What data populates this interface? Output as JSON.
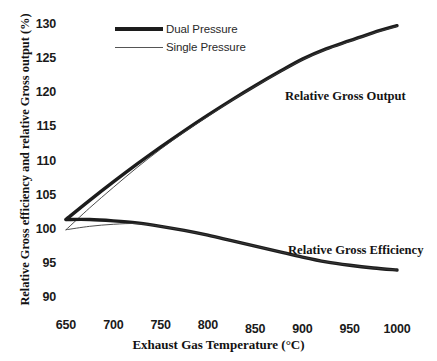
{
  "chart_data": {
    "type": "line",
    "title": "",
    "xlabel": "Exhaust Gas Temperature (°C)",
    "ylabel": "Relative Gross efficiency and relative Gross output (%)",
    "xlim": [
      630,
      1015
    ],
    "ylim": [
      89,
      131
    ],
    "xticks": [
      650,
      700,
      750,
      800,
      850,
      900,
      950,
      1000
    ],
    "xtick_labels": [
      "650",
      "700",
      "750",
      "800",
      "850",
      "900",
      "950",
      "1000"
    ],
    "yticks": [
      90,
      95,
      100,
      105,
      110,
      115,
      120,
      125,
      130
    ],
    "ytick_labels": [
      "90",
      "95",
      "100",
      "105",
      "110",
      "115",
      "120",
      "125",
      "130"
    ],
    "grid": false,
    "axis_lines_visible": false,
    "legend_position": "top-left-inside",
    "legend": [
      "Dual Pressure",
      "Single Pressure"
    ],
    "annotations": [
      {
        "text": "Relative Gross Output",
        "x": 905,
        "y": 119.5
      },
      {
        "text": "Relative Gross Efficiency",
        "x": 910,
        "y": 98.2
      }
    ],
    "series": [
      {
        "name": "Dual Pressure - Relative Gross Output",
        "group": "Relative Gross Output",
        "style": "thick",
        "color": "#1c1c1c",
        "x": [
          650,
          675,
          700,
          725,
          750,
          775,
          800,
          825,
          850,
          875,
          900,
          925,
          950,
          975,
          1000
        ],
        "y": [
          101.5,
          104.3,
          107.0,
          109.6,
          112.1,
          114.5,
          116.8,
          119.0,
          121.1,
          123.1,
          125.0,
          126.5,
          127.7,
          128.9,
          129.9
        ]
      },
      {
        "name": "Single Pressure - Relative Gross Output",
        "group": "Relative Gross Output",
        "style": "thin",
        "color": "#3a3a3a",
        "x": [
          650,
          675,
          700,
          725,
          750,
          775,
          800,
          825,
          850,
          875,
          900,
          925,
          950,
          975,
          1000
        ],
        "y": [
          100.0,
          103.2,
          106.2,
          109.1,
          111.8,
          114.3,
          116.6,
          118.9,
          121.0,
          123.0,
          124.9,
          126.4,
          127.6,
          128.8,
          129.8
        ]
      },
      {
        "name": "Dual Pressure - Relative Gross Efficiency",
        "group": "Relative Gross Efficiency",
        "style": "thick",
        "color": "#1c1c1c",
        "x": [
          650,
          675,
          700,
          725,
          750,
          775,
          800,
          825,
          850,
          875,
          900,
          925,
          950,
          975,
          1000
        ],
        "y": [
          101.5,
          101.5,
          101.3,
          101.0,
          100.5,
          99.9,
          99.2,
          98.4,
          97.6,
          96.8,
          96.0,
          95.3,
          94.8,
          94.4,
          94.1
        ]
      },
      {
        "name": "Single Pressure - Relative Gross Efficiency",
        "group": "Relative Gross Efficiency",
        "style": "thin",
        "color": "#3a3a3a",
        "x": [
          650,
          675,
          700,
          725,
          750,
          775,
          800,
          825,
          850,
          875,
          900,
          925,
          950,
          975,
          1000
        ],
        "y": [
          100.0,
          100.5,
          100.8,
          100.9,
          100.5,
          99.9,
          99.2,
          98.4,
          97.6,
          96.8,
          96.0,
          95.3,
          94.8,
          94.4,
          94.1
        ]
      }
    ]
  },
  "legend": {
    "items": [
      {
        "label": "Dual Pressure",
        "style": "thick"
      },
      {
        "label": "Single Pressure",
        "style": "thin"
      }
    ]
  },
  "axes": {
    "x_title": "Exhaust Gas Temperature (°C)",
    "y_title": "Relative Gross efficiency and relative Gross output (%)"
  },
  "annotations": {
    "output": "Relative Gross Output",
    "efficiency": "Relative Gross Efficiency"
  },
  "colors": {
    "line_dual": "#1c1c1c",
    "line_single": "#3a3a3a",
    "text": "#141414",
    "background": "#ffffff"
  }
}
